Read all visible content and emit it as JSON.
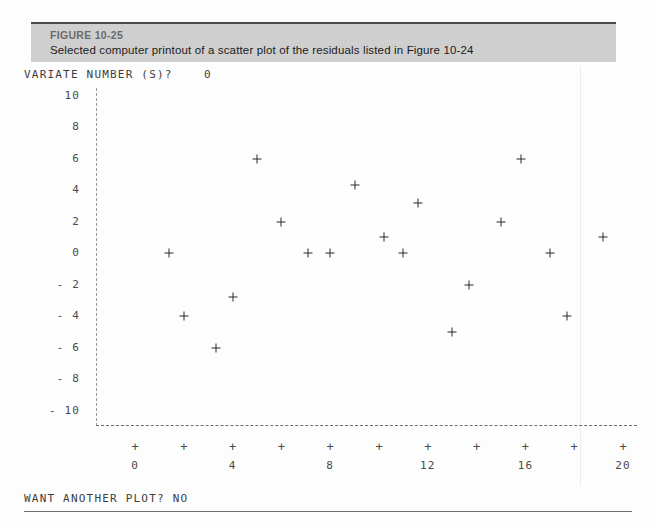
{
  "figure": {
    "number_label": "FIGURE 10-25",
    "title": "Selected computer printout of a scatter plot of the residuals listed in Figure 10-24"
  },
  "terminal": {
    "prompt_line": "VARIATE NUMBER (S)?    0",
    "footer_line": "WANT ANOTHER PLOT? NO"
  },
  "colors": {
    "caption_background": "#cfcfcf",
    "caption_rule": "#4a4a4a",
    "caption_number_text": "#6a6a6a",
    "caption_title_text": "#1b1b1b",
    "axis_dash": "#6d6d6d",
    "point_mark": "#2a2a2a",
    "tty_text": "#3d3d3d"
  },
  "chart_data": {
    "type": "scatter",
    "title": "Selected computer printout of a scatter plot of the residuals listed in Figure 10-24",
    "xlabel": "",
    "ylabel": "",
    "xlim": [
      -1,
      21
    ],
    "ylim": [
      -11,
      11
    ],
    "grid": false,
    "legend": null,
    "marker": "+",
    "y_tick_labels": [
      "10",
      "8",
      "6",
      "4",
      "2",
      "0",
      "-2",
      "-4",
      "-6",
      "-8",
      "-10"
    ],
    "y_ticks": [
      10,
      8,
      6,
      4,
      2,
      0,
      -2,
      -4,
      -6,
      -8,
      -10
    ],
    "x_tick_marks": [
      0,
      2,
      4,
      6,
      8,
      10,
      12,
      14,
      16,
      18,
      20
    ],
    "x_tick_glyph": "+",
    "x_tick_labels": [
      {
        "value": 0,
        "label": "0"
      },
      {
        "value": 4,
        "label": "4"
      },
      {
        "value": 8,
        "label": "8"
      },
      {
        "value": 12,
        "label": "12"
      },
      {
        "value": 16,
        "label": "16"
      },
      {
        "value": 20,
        "label": "20"
      }
    ],
    "points": [
      {
        "x": 1.4,
        "y": 0.0
      },
      {
        "x": 2.0,
        "y": -4.0
      },
      {
        "x": 3.3,
        "y": -6.0
      },
      {
        "x": 4.0,
        "y": -2.8
      },
      {
        "x": 5.0,
        "y": 6.0
      },
      {
        "x": 6.0,
        "y": 2.0
      },
      {
        "x": 7.1,
        "y": 0.0
      },
      {
        "x": 8.0,
        "y": 0.0
      },
      {
        "x": 9.0,
        "y": 4.3
      },
      {
        "x": 10.2,
        "y": 1.0
      },
      {
        "x": 11.0,
        "y": 0.0
      },
      {
        "x": 11.6,
        "y": 3.2
      },
      {
        "x": 13.0,
        "y": -5.0
      },
      {
        "x": 13.7,
        "y": -2.0
      },
      {
        "x": 15.0,
        "y": 2.0
      },
      {
        "x": 15.8,
        "y": 6.0
      },
      {
        "x": 17.0,
        "y": 0.0
      },
      {
        "x": 17.7,
        "y": -4.0
      },
      {
        "x": 19.2,
        "y": 1.0
      }
    ]
  }
}
